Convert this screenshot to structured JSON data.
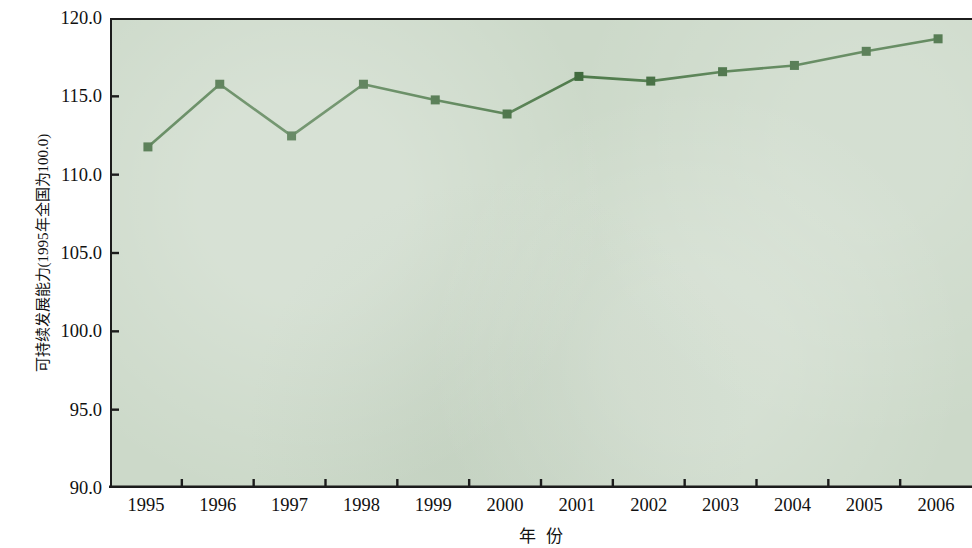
{
  "chart_data": {
    "type": "line",
    "title": "",
    "xlabel": "年 份",
    "ylabel": "可持续发展能力(1995年全国为100.0)",
    "categories": [
      "1995",
      "1996",
      "1997",
      "1998",
      "1999",
      "2000",
      "2001",
      "2002",
      "2003",
      "2004",
      "2005",
      "2006"
    ],
    "values": [
      111.9,
      115.9,
      112.6,
      115.9,
      114.9,
      114.0,
      116.4,
      116.1,
      116.7,
      117.1,
      118.0,
      118.8
    ],
    "series": [
      {
        "name": "可持续发展能力",
        "values": [
          111.9,
          115.9,
          112.6,
          115.9,
          114.9,
          114.0,
          116.4,
          116.1,
          116.7,
          117.1,
          118.0,
          118.8
        ]
      }
    ],
    "ylim": [
      90.0,
      120.0
    ],
    "ytick_labels": [
      "120.0",
      "115.0",
      "110.0",
      "105.0",
      "100.0",
      "95.0",
      "90.0"
    ],
    "ytick_values": [
      120.0,
      115.0,
      110.0,
      105.0,
      100.0,
      95.0,
      90.0
    ],
    "ytick_interval": 5.0,
    "grid": false,
    "legend": false,
    "legend_position": "none",
    "plot_background_color": "#ccd9c9",
    "line_color": "#4e7a4a",
    "marker_color": "#3f6a3c",
    "marker_shape": "square",
    "axis_color": "#1c1c1c"
  },
  "axes": {
    "y_title": "可持续发展能力(1995年全国为100.0)",
    "x_title_part1": "年",
    "x_title_part2": "份"
  }
}
